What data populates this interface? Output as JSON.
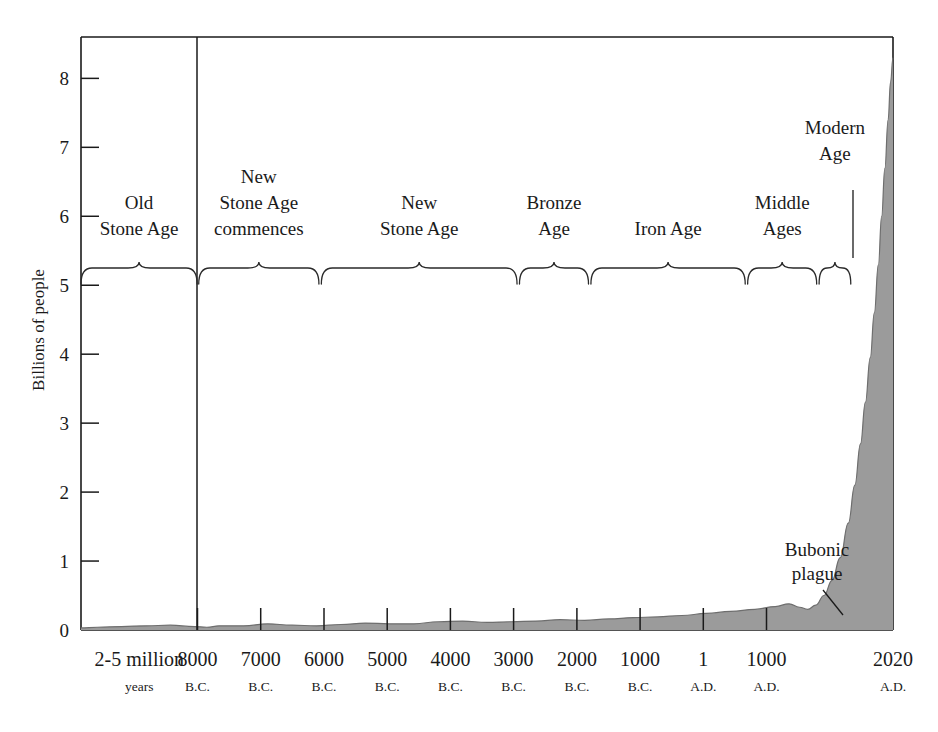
{
  "top_strip": {
    "text": "",
    "visible": true
  },
  "chart_data": {
    "type": "area",
    "title": "",
    "xlabel": "",
    "ylabel": "Billions of people",
    "ylim": [
      0,
      8.6
    ],
    "y_ticks": [
      0,
      1,
      2,
      3,
      4,
      5,
      6,
      7,
      8
    ],
    "y_tick_labels": [
      "0",
      "1",
      "2",
      "3",
      "4",
      "5",
      "6",
      "7",
      "8"
    ],
    "grid": false,
    "legend": "none",
    "fill_color": "#9b9b9b",
    "line_color": "#6e6e6e",
    "axis_color": "#1a1a1a",
    "x_tick_labels_main": [
      "2-5 million",
      "8000",
      "7000",
      "6000",
      "5000",
      "4000",
      "3000",
      "2000",
      "1000",
      "1",
      "1000",
      "2020"
    ],
    "x_tick_labels_sub": [
      "years",
      "B.C.",
      "B.C.",
      "B.C.",
      "B.C.",
      "B.C.",
      "B.C.",
      "B.C.",
      "B.C.",
      "A.D.",
      "A.D.",
      "A.D."
    ],
    "categories": [
      "2-5 million years",
      "8000 B.C.",
      "7000 B.C.",
      "6000 B.C.",
      "5000 B.C.",
      "4000 B.C.",
      "3000 B.C.",
      "2000 B.C.",
      "1000 B.C.",
      "1 A.D.",
      "1000 A.D.",
      "2020 A.D."
    ],
    "values": [
      0.002,
      0.005,
      0.007,
      0.01,
      0.02,
      0.03,
      0.05,
      0.07,
      0.12,
      0.2,
      0.31,
      7.8
    ],
    "points": [
      {
        "x": 0.0,
        "y": 0.03
      },
      {
        "x": 0.02,
        "y": 0.04
      },
      {
        "x": 0.05,
        "y": 0.05
      },
      {
        "x": 0.08,
        "y": 0.06
      },
      {
        "x": 0.11,
        "y": 0.07
      },
      {
        "x": 0.14,
        "y": 0.05
      },
      {
        "x": 0.155,
        "y": 0.04
      },
      {
        "x": 0.17,
        "y": 0.06
      },
      {
        "x": 0.2,
        "y": 0.06
      },
      {
        "x": 0.23,
        "y": 0.09
      },
      {
        "x": 0.26,
        "y": 0.07
      },
      {
        "x": 0.29,
        "y": 0.06
      },
      {
        "x": 0.32,
        "y": 0.08
      },
      {
        "x": 0.35,
        "y": 0.1
      },
      {
        "x": 0.38,
        "y": 0.09
      },
      {
        "x": 0.41,
        "y": 0.09
      },
      {
        "x": 0.44,
        "y": 0.12
      },
      {
        "x": 0.47,
        "y": 0.13
      },
      {
        "x": 0.5,
        "y": 0.11
      },
      {
        "x": 0.53,
        "y": 0.12
      },
      {
        "x": 0.56,
        "y": 0.13
      },
      {
        "x": 0.59,
        "y": 0.15
      },
      {
        "x": 0.62,
        "y": 0.14
      },
      {
        "x": 0.65,
        "y": 0.16
      },
      {
        "x": 0.68,
        "y": 0.18
      },
      {
        "x": 0.71,
        "y": 0.19
      },
      {
        "x": 0.74,
        "y": 0.21
      },
      {
        "x": 0.77,
        "y": 0.24
      },
      {
        "x": 0.8,
        "y": 0.27
      },
      {
        "x": 0.83,
        "y": 0.3
      },
      {
        "x": 0.855,
        "y": 0.34
      },
      {
        "x": 0.872,
        "y": 0.38
      },
      {
        "x": 0.885,
        "y": 0.33
      },
      {
        "x": 0.895,
        "y": 0.3
      },
      {
        "x": 0.905,
        "y": 0.36
      },
      {
        "x": 0.915,
        "y": 0.5
      },
      {
        "x": 0.925,
        "y": 0.72
      },
      {
        "x": 0.935,
        "y": 1.05
      },
      {
        "x": 0.945,
        "y": 1.55
      },
      {
        "x": 0.953,
        "y": 2.1
      },
      {
        "x": 0.96,
        "y": 2.7
      },
      {
        "x": 0.966,
        "y": 3.3
      },
      {
        "x": 0.972,
        "y": 3.95
      },
      {
        "x": 0.977,
        "y": 4.6
      },
      {
        "x": 0.982,
        "y": 5.3
      },
      {
        "x": 0.986,
        "y": 6.0
      },
      {
        "x": 0.99,
        "y": 6.7
      },
      {
        "x": 0.994,
        "y": 7.4
      },
      {
        "x": 0.997,
        "y": 7.95
      },
      {
        "x": 1.0,
        "y": 8.3
      }
    ],
    "era_bands": [
      {
        "id": "old-stone-age",
        "label_lines": [
          "Old",
          "Stone Age"
        ],
        "x_start": 0.0,
        "x_end": 0.143
      },
      {
        "id": "new-stone-age-commences",
        "label_lines": [
          "New",
          "Stone Age",
          "commences"
        ],
        "x_start": 0.145,
        "x_end": 0.293
      },
      {
        "id": "new-stone-age",
        "label_lines": [
          "New",
          "Stone Age"
        ],
        "x_start": 0.296,
        "x_end": 0.537
      },
      {
        "id": "bronze-age",
        "label_lines": [
          "Bronze",
          "Age"
        ],
        "x_start": 0.54,
        "x_end": 0.625
      },
      {
        "id": "iron-age",
        "label_lines": [
          "Iron Age"
        ],
        "x_start": 0.628,
        "x_end": 0.818
      },
      {
        "id": "middle-ages",
        "label_lines": [
          "Middle",
          "Ages"
        ],
        "x_start": 0.821,
        "x_end": 0.906
      },
      {
        "id": "modern-age",
        "label_lines": [
          "Modern",
          "Age"
        ],
        "x_start": 0.909,
        "x_end": 0.948
      }
    ],
    "annotations": [
      {
        "id": "bubonic-plague",
        "label_lines": [
          "Bubonic",
          "plague"
        ],
        "target_x": 0.893,
        "target_y": 0.33
      },
      {
        "id": "modern-age-leader",
        "label_lines": [],
        "target_x": 0.928,
        "target_y": 5.35
      }
    ],
    "divider_line": {
      "id": "8000-bc-divider",
      "x": 0.1435
    }
  }
}
